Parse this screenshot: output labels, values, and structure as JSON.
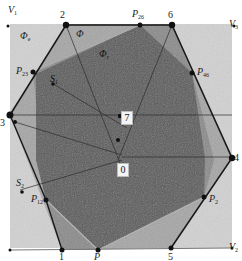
{
  "figure": {
    "outer_square": {
      "corners": [
        "V1",
        "V3",
        "V2"
      ]
    },
    "outer_corner_labels": [
      {
        "id": "V1",
        "text": "V",
        "sub": "1"
      },
      {
        "id": "V3",
        "text": "V",
        "sub": "3"
      },
      {
        "id": "V2",
        "text": "V",
        "sub": "2"
      }
    ],
    "hexagon_vertex_labels": [
      {
        "id": "v2",
        "text": "2"
      },
      {
        "id": "v6",
        "text": "6"
      },
      {
        "id": "v4",
        "text": "4"
      },
      {
        "id": "v5",
        "text": "5"
      },
      {
        "id": "v1",
        "text": "1"
      },
      {
        "id": "v3",
        "text": "3"
      }
    ],
    "intersection_labels": [
      {
        "id": "P26",
        "text": "P",
        "sub": "26"
      },
      {
        "id": "P46",
        "text": "P",
        "sub": "46"
      },
      {
        "id": "P23",
        "text": "P",
        "sub": "23"
      },
      {
        "id": "P12",
        "text": "P",
        "sub": "12"
      },
      {
        "id": "P2",
        "text": "P",
        "sub": "2"
      },
      {
        "id": "P",
        "text": "P",
        "sub": ""
      }
    ],
    "region_labels": [
      {
        "id": "phi_e",
        "text": "Φ",
        "sub": "e"
      },
      {
        "id": "phi",
        "text": "Φ",
        "sub": ""
      },
      {
        "id": "phi_r",
        "text": "Φ",
        "sub": "r"
      }
    ],
    "sensor_labels": [
      {
        "id": "S1",
        "text": "S",
        "sub": "1"
      },
      {
        "id": "S2",
        "text": "S",
        "sub": "2"
      }
    ],
    "boxed_labels": [
      {
        "id": "b7",
        "text": "7"
      },
      {
        "id": "b0",
        "text": "0"
      }
    ],
    "colors": {
      "outer_fill": "#d2d2d2",
      "hexagon_fill": "#a9a9a9",
      "mid_fill": "#8c8c8c",
      "dark_fill": "#585858",
      "edge": "#1a1a1a",
      "light_edge": "#b8b8b8"
    }
  }
}
